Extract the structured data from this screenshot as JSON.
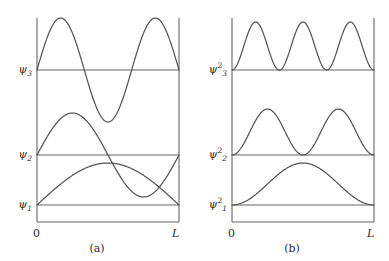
{
  "figure": {
    "stroke_color": "#555555",
    "axis_color": "#666666",
    "text_color": "#2b2b2b",
    "background": "#ffffff"
  },
  "panels": [
    {
      "id": "a",
      "caption": "(a)",
      "quantity": "wavefunction",
      "x_axis": {
        "start_label": "0",
        "end_label": "L",
        "domain": [
          0,
          1
        ]
      },
      "levels": [
        {
          "label_base": "ψ",
          "label_sub": "1",
          "label_sup": "",
          "label_text": "ψ1",
          "n": 1
        },
        {
          "label_base": "ψ",
          "label_sub": "2",
          "label_sup": "",
          "label_text": "ψ2",
          "n": 2
        },
        {
          "label_base": "ψ",
          "label_sub": "3",
          "label_sup": "",
          "label_text": "ψ3",
          "n": 3
        }
      ]
    },
    {
      "id": "b",
      "caption": "(b)",
      "quantity": "probability-density",
      "x_axis": {
        "start_label": "0",
        "end_label": "L",
        "domain": [
          0,
          1
        ]
      },
      "levels": [
        {
          "label_base": "ψ",
          "label_sub": "1",
          "label_sup": "2",
          "label_text": "ψ1²",
          "n": 1
        },
        {
          "label_base": "ψ",
          "label_sub": "2",
          "label_sup": "2",
          "label_text": "ψ2²",
          "n": 2
        },
        {
          "label_base": "ψ",
          "label_sub": "3",
          "label_sup": "2",
          "label_text": "ψ3²",
          "n": 3
        }
      ]
    }
  ],
  "chart_data": [
    {
      "type": "line",
      "panel": "a",
      "title": "(a)",
      "xlabel": "",
      "ylabel": "",
      "xlim": [
        0,
        1
      ],
      "xtick_labels": [
        "0",
        "L"
      ],
      "xtick_values": [
        0,
        1
      ],
      "grid": false,
      "legend": "none",
      "annotations": [
        "ψ1",
        "ψ2",
        "ψ3"
      ],
      "description": "Infinite square well eigenfunctions psi_n(x) = sin(n*pi*x/L), each drawn on its own baseline (energy level).",
      "series": [
        {
          "name": "ψ1",
          "formula": "sin(pi*x/L)",
          "baseline_y_px": 205,
          "amplitude_px": 42,
          "nodes": [
            0,
            1
          ],
          "peaks": [
            {
              "x": 0.5,
              "y": 1
            }
          ],
          "x": [
            0,
            0.1,
            0.2,
            0.3,
            0.4,
            0.5,
            0.6,
            0.7,
            0.8,
            0.9,
            1
          ],
          "values": [
            0,
            0.309,
            0.588,
            0.809,
            0.951,
            1.0,
            0.951,
            0.809,
            0.588,
            0.309,
            0
          ]
        },
        {
          "name": "ψ2",
          "formula": "sin(2*pi*x/L)",
          "baseline_y_px": 155,
          "amplitude_px": 42,
          "nodes": [
            0,
            0.5,
            1
          ],
          "peaks": [
            {
              "x": 0.25,
              "y": 1
            },
            {
              "x": 0.75,
              "y": -1
            }
          ],
          "x": [
            0,
            0.1,
            0.2,
            0.25,
            0.3,
            0.4,
            0.5,
            0.6,
            0.7,
            0.75,
            0.8,
            0.9,
            1
          ],
          "values": [
            0,
            0.588,
            0.951,
            1.0,
            0.951,
            0.588,
            0,
            -0.588,
            -0.951,
            -1.0,
            -0.951,
            -0.588,
            0
          ]
        },
        {
          "name": "ψ3",
          "formula": "sin(3*pi*x/L)",
          "baseline_y_px": 70,
          "amplitude_px": 52,
          "nodes": [
            0,
            0.3333,
            0.6667,
            1
          ],
          "peaks": [
            {
              "x": 0.1667,
              "y": 1
            },
            {
              "x": 0.5,
              "y": -1
            },
            {
              "x": 0.8333,
              "y": 1
            }
          ],
          "x": [
            0,
            0.0833,
            0.1667,
            0.25,
            0.3333,
            0.4167,
            0.5,
            0.5833,
            0.6667,
            0.75,
            0.8333,
            0.9167,
            1
          ],
          "values": [
            0,
            0.707,
            1.0,
            0.707,
            0,
            -0.707,
            -1.0,
            -0.707,
            0,
            0.707,
            1.0,
            0.707,
            0
          ]
        }
      ]
    },
    {
      "type": "line",
      "panel": "b",
      "title": "(b)",
      "xlabel": "",
      "ylabel": "",
      "xlim": [
        0,
        1
      ],
      "xtick_labels": [
        "0",
        "L"
      ],
      "xtick_values": [
        0,
        1
      ],
      "grid": false,
      "legend": "none",
      "annotations": [
        "ψ1²",
        "ψ2²",
        "ψ3²"
      ],
      "description": "Probability densities |psi_n(x)|^2 = sin^2(n*pi*x/L), all non-negative, each on its own baseline.",
      "series": [
        {
          "name": "ψ1²",
          "formula": "sin^2(pi*x/L)",
          "baseline_y_px": 205,
          "amplitude_px": 42,
          "nodes": [
            0,
            1
          ],
          "peaks": [
            {
              "x": 0.5,
              "y": 1
            }
          ],
          "x": [
            0,
            0.1,
            0.2,
            0.3,
            0.4,
            0.5,
            0.6,
            0.7,
            0.8,
            0.9,
            1
          ],
          "values": [
            0,
            0.095,
            0.345,
            0.655,
            0.905,
            1.0,
            0.905,
            0.655,
            0.345,
            0.095,
            0
          ]
        },
        {
          "name": "ψ2²",
          "formula": "sin^2(2*pi*x/L)",
          "baseline_y_px": 155,
          "amplitude_px": 46,
          "nodes": [
            0,
            0.5,
            1
          ],
          "peaks": [
            {
              "x": 0.25,
              "y": 1
            },
            {
              "x": 0.75,
              "y": 1
            }
          ],
          "x": [
            0,
            0.125,
            0.25,
            0.375,
            0.5,
            0.625,
            0.75,
            0.875,
            1
          ],
          "values": [
            0,
            0.5,
            1.0,
            0.5,
            0,
            0.5,
            1.0,
            0.5,
            0
          ]
        },
        {
          "name": "ψ3²",
          "formula": "sin^2(3*pi*x/L)",
          "baseline_y_px": 70,
          "amplitude_px": 48,
          "nodes": [
            0,
            0.3333,
            0.6667,
            1
          ],
          "peaks": [
            {
              "x": 0.1667,
              "y": 1
            },
            {
              "x": 0.5,
              "y": 1
            },
            {
              "x": 0.8333,
              "y": 1
            }
          ],
          "x": [
            0,
            0.0833,
            0.1667,
            0.25,
            0.3333,
            0.4167,
            0.5,
            0.5833,
            0.6667,
            0.75,
            0.8333,
            0.9167,
            1
          ],
          "values": [
            0,
            0.5,
            1.0,
            0.5,
            0,
            0.5,
            1.0,
            0.5,
            0,
            0.5,
            1.0,
            0.5,
            0
          ]
        }
      ]
    }
  ]
}
